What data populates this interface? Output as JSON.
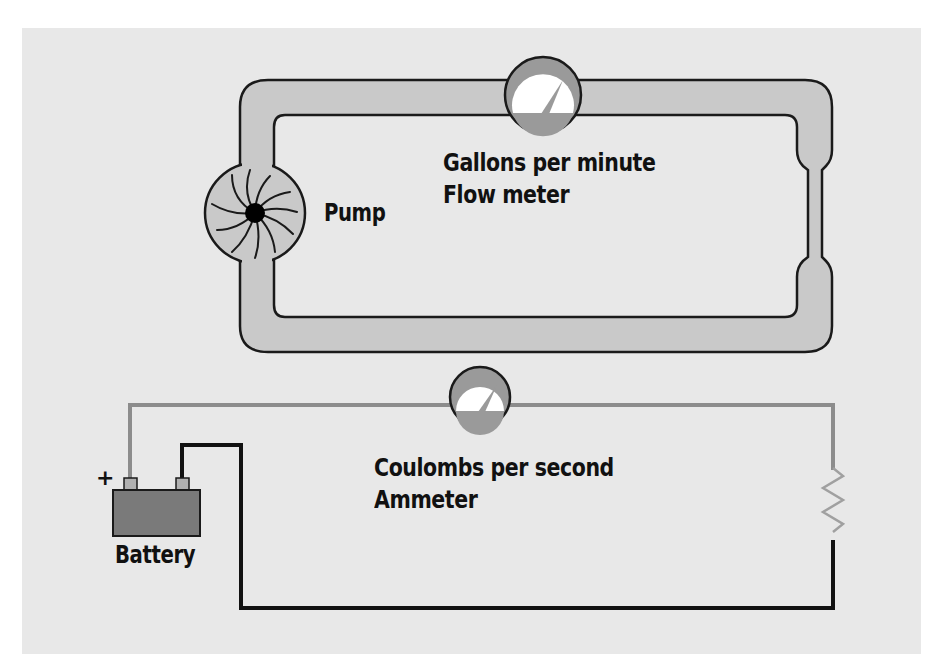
{
  "diagram": {
    "type": "analogy",
    "water_circuit": {
      "components": [
        {
          "id": "pump",
          "label": "Pump"
        },
        {
          "id": "flow_meter",
          "label_line1": "Gallons per minute",
          "label_line2": "Flow meter"
        },
        {
          "id": "narrow_pipe",
          "label": ""
        }
      ]
    },
    "electric_circuit": {
      "components": [
        {
          "id": "battery",
          "label": "Battery",
          "positive_symbol": "+"
        },
        {
          "id": "ammeter",
          "label_line1": "Coulombs per second",
          "label_line2": "Ammeter"
        },
        {
          "id": "resistor",
          "label": ""
        }
      ]
    },
    "colors": {
      "background": "#e8e8e8",
      "pipe_fill": "#c9c9c9",
      "outline": "#1a1a1a",
      "positive_wire": "#8c8c8c",
      "negative_wire": "#111111",
      "battery_fill": "#7a7a7a",
      "meter_ring": "#9a9a9a",
      "meter_face": "#ffffff"
    }
  },
  "labels": {
    "pump": "Pump",
    "flow_line1": "Gallons per minute",
    "flow_line2": "Flow meter",
    "ammeter_line1": "Coulombs per second",
    "ammeter_line2": "Ammeter",
    "battery": "Battery",
    "plus": "+"
  }
}
